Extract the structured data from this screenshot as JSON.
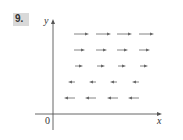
{
  "problem": {
    "number": "9."
  },
  "chart_data": {
    "type": "vector_field",
    "title": "",
    "xlabel": "x",
    "ylabel": "y",
    "origin_label": "0",
    "rows": [
      {
        "y_px": 34,
        "direction": "right",
        "length_px": 15,
        "x_starts_px": [
          74,
          96,
          117,
          139
        ]
      },
      {
        "y_px": 50,
        "direction": "right",
        "length_px": 11,
        "x_starts_px": [
          74,
          96,
          117,
          139
        ]
      },
      {
        "y_px": 66,
        "direction": "right",
        "length_px": 8,
        "x_starts_px": [
          75,
          97,
          118,
          140
        ]
      },
      {
        "y_px": 82,
        "direction": "left",
        "length_px": 7,
        "x_starts_px": [
          68,
          89,
          110,
          132
        ]
      },
      {
        "y_px": 98,
        "direction": "left",
        "length_px": 11,
        "x_starts_px": [
          64,
          85,
          107,
          128
        ]
      }
    ],
    "axes": {
      "origin_px": [
        53,
        114
      ],
      "x_end_px": 162,
      "y_top_px": 19
    },
    "grid": false
  },
  "colors": {
    "axis": "#555555",
    "arrow": "#666666",
    "badge": "#d9d9d9"
  }
}
